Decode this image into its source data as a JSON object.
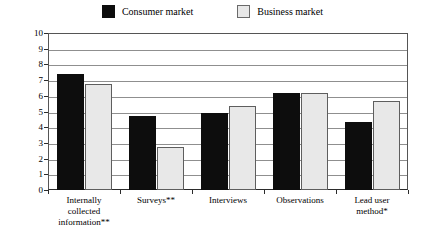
{
  "chart_data": {
    "type": "bar",
    "title": "",
    "subtitle": "",
    "xlabel": "",
    "ylabel": "Use of techniques [0, 10]",
    "ylim": [
      0,
      10
    ],
    "ytick_labels": [
      "10",
      "9",
      "8",
      "7",
      "6",
      "5",
      "4",
      "3",
      "2",
      "1",
      "0"
    ],
    "yticks": [
      10,
      9,
      8,
      7,
      6,
      5,
      4,
      3,
      2,
      1,
      0
    ],
    "grid": true,
    "legend_position": "top-center",
    "categories": [
      "Internally collected information**",
      "Surveys**",
      "Interviews",
      "Observations",
      "Lead user method*"
    ],
    "category_lines": [
      [
        "Internally",
        "collected",
        "information**"
      ],
      [
        "Surveys**"
      ],
      [
        "Interviews"
      ],
      [
        "Observations"
      ],
      [
        "Lead user",
        "method*"
      ]
    ],
    "series": [
      {
        "name": "Consumer market",
        "color": "#0d0d0d",
        "values": [
          7.4,
          4.7,
          4.9,
          6.2,
          4.35
        ]
      },
      {
        "name": "Business market",
        "color": "#e8e8e8",
        "values": [
          6.75,
          2.75,
          5.35,
          6.2,
          5.7
        ]
      }
    ],
    "annotations": []
  },
  "legend": {
    "entries": [
      {
        "label": "Consumer market",
        "swatch": "filled-black-square-icon"
      },
      {
        "label": "Business market",
        "swatch": "outlined-gray-square-icon"
      }
    ]
  }
}
